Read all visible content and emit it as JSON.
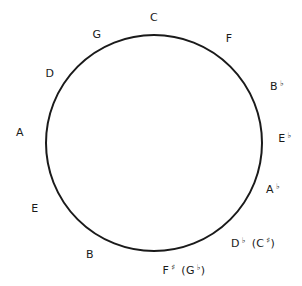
{
  "diagram": {
    "circle": {
      "cx": 154,
      "cy": 143,
      "r": 109,
      "stroke": "#1a1a1a"
    },
    "keys": [
      {
        "id": "c",
        "note": "C",
        "acc": "",
        "alt": "",
        "alt_acc": "",
        "x": 154,
        "y": 17
      },
      {
        "id": "f",
        "note": "F",
        "acc": "",
        "alt": "",
        "alt_acc": "",
        "x": 229,
        "y": 38
      },
      {
        "id": "bb",
        "note": "B",
        "acc": "♭",
        "alt": "",
        "alt_acc": "",
        "x": 277,
        "y": 86
      },
      {
        "id": "eb",
        "note": "E",
        "acc": "♭",
        "alt": "",
        "alt_acc": "",
        "x": 285,
        "y": 138
      },
      {
        "id": "ab",
        "note": "A",
        "acc": "♭",
        "alt": "",
        "alt_acc": "",
        "x": 273,
        "y": 189
      },
      {
        "id": "db",
        "note": "D",
        "acc": "♭",
        "alt": "C",
        "alt_acc": "♯",
        "x": 253,
        "y": 243
      },
      {
        "id": "fs",
        "note": "F",
        "acc": "♯",
        "alt": "G",
        "alt_acc": "♭",
        "x": 184,
        "y": 270
      },
      {
        "id": "b",
        "note": "B",
        "acc": "",
        "alt": "",
        "alt_acc": "",
        "x": 90,
        "y": 254
      },
      {
        "id": "e",
        "note": "E",
        "acc": "",
        "alt": "",
        "alt_acc": "",
        "x": 35,
        "y": 208
      },
      {
        "id": "a",
        "note": "A",
        "acc": "",
        "alt": "",
        "alt_acc": "",
        "x": 20,
        "y": 132
      },
      {
        "id": "d",
        "note": "D",
        "acc": "",
        "alt": "",
        "alt_acc": "",
        "x": 50,
        "y": 73
      },
      {
        "id": "g",
        "note": "G",
        "acc": "",
        "alt": "",
        "alt_acc": "",
        "x": 97,
        "y": 34
      }
    ]
  }
}
